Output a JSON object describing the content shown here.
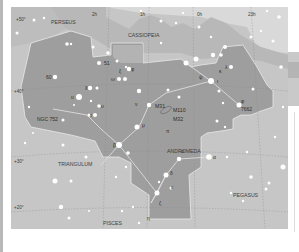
{
  "map": {
    "title": "Andromeda constellation chart",
    "colors": {
      "sky_outer": "#c8c8c8",
      "sky_light": "#dcdcdc",
      "milky_way": "#b5b5b5",
      "constellation_fill": "#9d9d9d",
      "border": "#e6e6e6",
      "star": "#ffffff",
      "label": "#404040"
    },
    "constellations": {
      "perseus": "PERSEUS",
      "cassiopeia": "CASSIOPEIA",
      "andromeda": "ANDROMEDA",
      "triangulum": "TRIANGULUM",
      "pegasus": "PEGASUS",
      "pisces": "PISCES"
    },
    "ra_labels": {
      "ra2": "2h",
      "ra1": "1h",
      "ra0": "0h",
      "ra23": "23h"
    },
    "dec_labels": {
      "dec50": "+50°",
      "dec40": "+40°",
      "dec30": "+30°",
      "dec20": "+20°"
    },
    "stars": {
      "s51": "51",
      "s60": "60",
      "omicron_phi": "φ",
      "lambda": "λ",
      "kappa": "κ",
      "iota": "ι",
      "psi": "ψ",
      "theta": "θ",
      "chi": "χ",
      "upsilon": "υ",
      "tau": "τ",
      "omega": "ω",
      "xi": "ξ",
      "nu": "ν",
      "mu": "μ",
      "beta": "β",
      "alpha": "α",
      "delta": "δ",
      "epsilon": "ε",
      "zeta": "ζ",
      "eta": "η",
      "pi": "π",
      "sigma": "σ",
      "gamma": "γ",
      "ngc752": "NGC 752",
      "ngc7662": "7662"
    },
    "deep_sky": {
      "m31": "M31",
      "m110": "M110",
      "m32": "M32"
    }
  }
}
